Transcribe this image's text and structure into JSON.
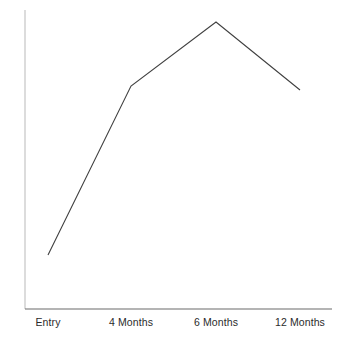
{
  "chart_data": {
    "type": "line",
    "title": "",
    "subtitle": "",
    "xlabel": "",
    "ylabel": "",
    "categories": [
      "Entry",
      "4 Months",
      "6 Months",
      "12 Months"
    ],
    "values": [
      18,
      75,
      97,
      74
    ],
    "series": [
      {
        "name": "",
        "values": [
          18,
          75,
          97,
          74
        ]
      }
    ],
    "xlim": [
      0,
      3
    ],
    "ylim": [
      0,
      100
    ],
    "grid": false,
    "legend": false,
    "legend_position": "none",
    "markers": false,
    "annotations": [],
    "axis_ticks": {
      "x": [
        "Entry",
        "4 Months",
        "6 Months",
        "12 Months"
      ],
      "y": []
    },
    "colors": {
      "line": "#404040",
      "x_axis": "#6b6b6b",
      "y_axis": "#b9b9b9",
      "background": "#ffffff",
      "tick_label": "#2b2b2b"
    },
    "pixel_geometry": {
      "points": [
        {
          "label": "Entry",
          "x": 48,
          "y": 255
        },
        {
          "label": "4 Months",
          "x": 131,
          "y": 86
        },
        {
          "label": "6 Months",
          "x": 216,
          "y": 22
        },
        {
          "label": "12 Months",
          "x": 300,
          "y": 90
        }
      ],
      "x_axis": {
        "x1": 25,
        "y1": 309,
        "x2": 332,
        "y2": 309
      },
      "y_axis": {
        "x1": 25,
        "y1": 10,
        "x2": 25,
        "y2": 309
      },
      "label_y": 316
    }
  }
}
